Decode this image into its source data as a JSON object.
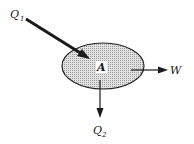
{
  "diagram": {
    "type": "control-volume energy flow",
    "region": {
      "label": "A",
      "fill": "#cfcfcf",
      "stroke": "#222222"
    },
    "arrows": [
      {
        "id": "q1",
        "label": "Q",
        "subscript": "1",
        "direction": "inward",
        "style": "thick"
      },
      {
        "id": "w",
        "label": "W",
        "subscript": "",
        "direction": "outward-right",
        "style": "thin"
      },
      {
        "id": "q2",
        "label": "Q",
        "subscript": "2",
        "direction": "outward-down",
        "style": "thin"
      }
    ]
  }
}
